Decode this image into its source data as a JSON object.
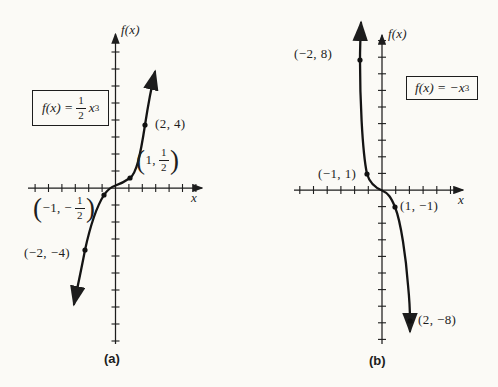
{
  "page": {
    "background": "#fbfaf6",
    "ink": "#1d1d1d"
  },
  "chart_data": [
    {
      "type": "line",
      "id": "a",
      "caption": "(a)",
      "function": "f(x) = (1/2)x^3",
      "formula": {
        "pre": "f(x) =",
        "frac": {
          "num": "1",
          "den": "2"
        },
        "post": "x",
        "sup": "3"
      },
      "xlabel": "x",
      "ylabel": "f(x)",
      "xlim": [
        -6,
        6
      ],
      "ylim": [
        -9,
        8
      ],
      "grid": false,
      "points": [
        {
          "x": 2,
          "y": 4,
          "label": "(2, 4)"
        },
        {
          "x": 1,
          "y": 0.5,
          "label_frac": {
            "open": "(",
            "pre": "1,",
            "num": "1",
            "den": "2",
            "close": ")"
          }
        },
        {
          "x": -1,
          "y": -0.5,
          "label_frac": {
            "open": "(",
            "pre": "−1, −",
            "num": "1",
            "den": "2",
            "close": ")"
          }
        },
        {
          "x": -2,
          "y": -4,
          "label": "(−2, −4)"
        }
      ]
    },
    {
      "type": "line",
      "id": "b",
      "caption": "(b)",
      "function": "f(x) = -x^3",
      "formula": {
        "pre": "f(x) = −x",
        "sup": "3"
      },
      "xlabel": "x",
      "ylabel": "f(x)",
      "xlim": [
        -6,
        5
      ],
      "ylim": [
        -9,
        9
      ],
      "grid": false,
      "points": [
        {
          "x": -2,
          "y": 8,
          "label": "(−2, 8)"
        },
        {
          "x": -1,
          "y": 1,
          "label": "(−1, 1)"
        },
        {
          "x": 1,
          "y": -1,
          "label": "(1, −1)"
        },
        {
          "x": 2,
          "y": -8,
          "label": "(2, −8)"
        }
      ]
    }
  ]
}
